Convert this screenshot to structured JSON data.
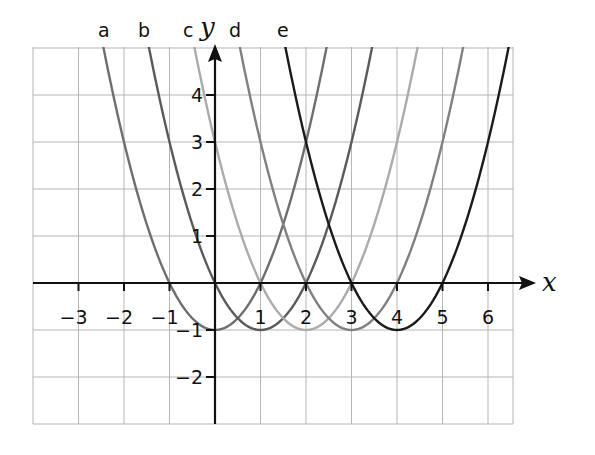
{
  "chart_data": {
    "type": "line",
    "title": "",
    "xlabel": "x",
    "ylabel": "y",
    "xlim": [
      -4,
      6.5
    ],
    "ylim": [
      -3,
      5
    ],
    "grid": true,
    "legend_position": "curve labels at top",
    "x_ticks": [
      -3,
      -2,
      -1,
      1,
      2,
      3,
      4,
      5,
      6
    ],
    "x_tick_labels": [
      "−3",
      "−2",
      "−1",
      "1",
      "2",
      "3",
      "4",
      "5",
      "6"
    ],
    "y_ticks": [
      4,
      3,
      2,
      1,
      -1,
      -2
    ],
    "y_tick_labels": [
      "4",
      "3",
      "2",
      "1",
      "−1",
      "−2"
    ],
    "series": [
      {
        "name": "a",
        "equation": "y = x² − 1",
        "vertex": [
          0,
          -1
        ],
        "x_intercepts": [
          -1,
          1
        ],
        "color": "#6e6e6e"
      },
      {
        "name": "b",
        "equation": "y = (x − 1)² − 1",
        "vertex": [
          1,
          -1
        ],
        "x_intercepts": [
          0,
          2
        ],
        "color": "#5a5a5a"
      },
      {
        "name": "c",
        "equation": "y = (x − 2)² − 1",
        "vertex": [
          2,
          -1
        ],
        "x_intercepts": [
          1,
          3
        ],
        "color": "#ababab"
      },
      {
        "name": "d",
        "equation": "y = (x − 3)² − 1",
        "vertex": [
          3,
          -1
        ],
        "x_intercepts": [
          2,
          4
        ],
        "color": "#808080"
      },
      {
        "name": "e",
        "equation": "y = (x − 4)² − 1",
        "vertex": [
          4,
          -1
        ],
        "x_intercepts": [
          3,
          5
        ],
        "color": "#1a1a1a"
      }
    ]
  },
  "labels": {
    "x_axis": "x",
    "y_axis": "y",
    "curves": [
      "a",
      "b",
      "c",
      "d",
      "e"
    ],
    "x_ticks": [
      "−3",
      "−2",
      "−1",
      "1",
      "2",
      "3",
      "4",
      "5",
      "6"
    ],
    "y_ticks": [
      "4",
      "3",
      "2",
      "1",
      "−1",
      "−2"
    ]
  }
}
